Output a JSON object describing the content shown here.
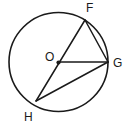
{
  "figure": {
    "stroke_color": "#1a1a1a",
    "background_color": "#ffffff",
    "label_color": "#1a1a1a"
  },
  "circle": {
    "name": "circle-O",
    "center_x": 58.5,
    "center_y": 62,
    "radius": 49.5
  },
  "points": [
    {
      "id": "O",
      "label": "O",
      "x": 58.5,
      "y": 62,
      "label_x": 45,
      "label_y": 61,
      "is_center": true
    },
    {
      "id": "F",
      "label": "F",
      "x": 85,
      "y": 20,
      "label_x": 86,
      "label_y": 12,
      "is_center": false
    },
    {
      "id": "G",
      "label": "G",
      "x": 108,
      "y": 62,
      "label_x": 113,
      "label_y": 67,
      "is_center": false
    },
    {
      "id": "H",
      "label": "H",
      "x": 36,
      "y": 101,
      "label_x": 24,
      "label_y": 121,
      "is_center": false
    }
  ],
  "segments": [
    {
      "id": "FH",
      "name": "diameter-f-h",
      "x1": 85,
      "y1": 20,
      "x2": 36,
      "y2": 101
    },
    {
      "id": "OG",
      "name": "radius-o-g",
      "x1": 58.5,
      "y1": 62,
      "x2": 108,
      "y2": 62
    },
    {
      "id": "FG",
      "name": "chord-f-g",
      "x1": 85,
      "y1": 20,
      "x2": 108,
      "y2": 62
    },
    {
      "id": "HG",
      "name": "chord-h-g",
      "x1": 36,
      "y1": 101,
      "x2": 108,
      "y2": 62
    }
  ],
  "chart_data": {
    "type": "diagram",
    "shapes": [
      {
        "kind": "circle",
        "label": "circle O",
        "center": [
          58.5,
          62
        ],
        "radius": 49.5
      },
      {
        "kind": "point",
        "label": "O",
        "at": [
          58.5,
          62
        ]
      },
      {
        "kind": "point",
        "label": "F",
        "at": [
          85,
          20
        ]
      },
      {
        "kind": "point",
        "label": "G",
        "at": [
          108,
          62
        ]
      },
      {
        "kind": "point",
        "label": "H",
        "at": [
          36,
          101
        ]
      },
      {
        "kind": "segment",
        "label": "FH",
        "from": [
          85,
          20
        ],
        "to": [
          36,
          101
        ]
      },
      {
        "kind": "segment",
        "label": "OG",
        "from": [
          58.5,
          62
        ],
        "to": [
          108,
          62
        ]
      },
      {
        "kind": "segment",
        "label": "FG",
        "from": [
          85,
          20
        ],
        "to": [
          108,
          62
        ]
      },
      {
        "kind": "segment",
        "label": "HG",
        "from": [
          36,
          101
        ],
        "to": [
          108,
          62
        ]
      }
    ],
    "labels": [
      "F",
      "G",
      "H",
      "O"
    ]
  }
}
